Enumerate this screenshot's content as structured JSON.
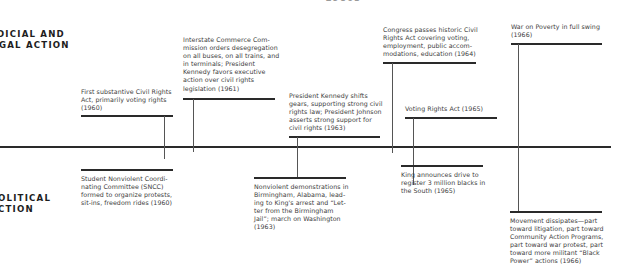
{
  "period_label": "1960s",
  "sections": {
    "top": {
      "line1": "JUDICIAL AND",
      "line2": "LEGAL ACTION",
      "visible_line1": "DICIAL AND",
      "visible_line2": "GAL ACTION"
    },
    "bottom": {
      "line1": "POLITICAL",
      "line2": "ACTION",
      "visible_line1": "OLITICAL",
      "visible_line2": "CTION"
    }
  },
  "judicial_legal_events": [
    {
      "year": "1960",
      "lines": [
        "First substantive Civil Rights",
        "Act, primarily voting rights",
        "(1960)"
      ]
    },
    {
      "year": "1961",
      "lines": [
        "Interstate Commerce Com-",
        "mission orders desegregation",
        "on all buses, on all trains, and",
        "in terminals; President",
        "Kennedy favors executive",
        "action over civil rights",
        "legislation (1961)"
      ]
    },
    {
      "year": "1963",
      "lines": [
        "President Kennedy shifts",
        "gears, supporting strong civil",
        "rights law; President Johnson",
        "asserts strong support for",
        "civil rights (1963)"
      ]
    },
    {
      "year": "1964",
      "lines": [
        "Congress passes historic Civil",
        "Rights Act covering voting,",
        "employment, public accom-",
        "modations, education (1964)"
      ]
    },
    {
      "year": "1965",
      "lines": [
        "Voting Rights Act (1965)"
      ]
    },
    {
      "year": "1966",
      "lines": [
        "War on Poverty in full swing",
        "(1966)"
      ]
    }
  ],
  "political_action_events": [
    {
      "year": "1960",
      "lines": [
        "Student Nonviolent Coordi-",
        "nating Committee (SNCC)",
        "formed to organize protests,",
        "sit-ins, freedom rides (1960)"
      ]
    },
    {
      "year": "1963",
      "lines": [
        "Nonviolent demonstrations in",
        "Birmingham, Alabama, lead-",
        "ing to King's arrest and “Let-",
        "ter from the Birmingham",
        "Jail”; march on Washington",
        "(1963)"
      ]
    },
    {
      "year": "1965",
      "lines": [
        "King announces drive to",
        "register 3 million blacks in",
        "the South (1965)"
      ]
    },
    {
      "year": "1966",
      "lines": [
        "Movement dissipates—part",
        "toward litigation, part toward",
        "Community Action Programs,",
        "part toward war protest, part",
        "toward more militant “Black",
        "Power” actions (1966)"
      ]
    }
  ]
}
